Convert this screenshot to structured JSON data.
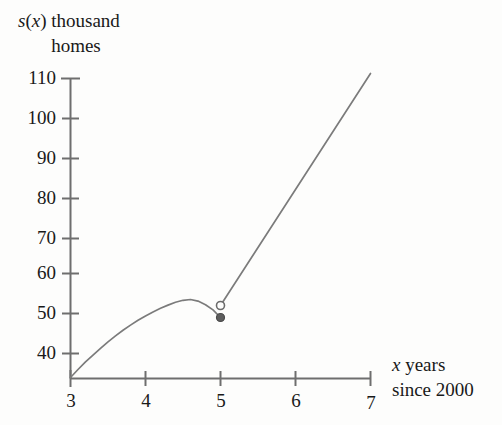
{
  "chart_data": {
    "type": "line",
    "title": "",
    "subtitle": "",
    "ylabel_line1": "s(x) thousand",
    "ylabel_line2": "homes",
    "ylabel_italic_token": "x",
    "xlabel_line1": "x years",
    "xlabel_line2": "since 2000",
    "xlabel_italic_token": "x",
    "xlim": [
      3,
      7
    ],
    "ylim": [
      33.75,
      110
    ],
    "xticks": [
      3,
      4,
      5,
      6,
      7
    ],
    "xtick_labels": [
      "3",
      "4",
      "5",
      "6",
      "7"
    ],
    "yticks": [
      40,
      50,
      60,
      70,
      80,
      90,
      100,
      110
    ],
    "ytick_labels": [
      "40",
      "50",
      "60",
      "70",
      "80",
      "90",
      "100",
      "110"
    ],
    "grid": false,
    "legend": "none",
    "axis_color": "#6e6e6e",
    "curve_color": "#7b7b7b",
    "text_color": "#191919",
    "background": "#fdfdfc",
    "series": [
      {
        "name": "parabolic-branch",
        "kind": "curve",
        "domain": [
          3,
          5
        ],
        "points": [
          [
            3.0,
            34.0
          ],
          [
            3.1,
            36.0
          ],
          [
            3.2,
            37.9
          ],
          [
            3.3,
            39.6
          ],
          [
            3.4,
            41.3
          ],
          [
            3.5,
            42.9
          ],
          [
            3.6,
            44.4
          ],
          [
            3.7,
            45.8
          ],
          [
            3.8,
            47.1
          ],
          [
            3.9,
            48.3
          ],
          [
            4.0,
            49.4
          ],
          [
            4.1,
            50.4
          ],
          [
            4.2,
            51.3
          ],
          [
            4.3,
            52.1
          ],
          [
            4.4,
            52.8
          ],
          [
            4.5,
            53.3
          ],
          [
            4.6,
            53.5
          ],
          [
            4.7,
            53.1
          ],
          [
            4.8,
            52.2
          ],
          [
            4.9,
            50.9
          ],
          [
            5.0,
            49.0
          ]
        ],
        "endpoint_marker": "filled-dot",
        "endpoint": [
          5.0,
          49.0
        ]
      },
      {
        "name": "linear-branch",
        "kind": "line",
        "domain": [
          5,
          7
        ],
        "points": [
          [
            5.0,
            52.0
          ],
          [
            7.0,
            110.0
          ]
        ],
        "start_marker": "open-circle",
        "start_point": [
          5.0,
          52.0
        ],
        "slope": 29.0
      }
    ],
    "markers": [
      {
        "name": "open-circle",
        "x": 5.0,
        "y": 52.0,
        "filled": false
      },
      {
        "name": "closed-dot",
        "x": 5.0,
        "y": 49.0,
        "filled": true
      }
    ],
    "annotations": []
  }
}
